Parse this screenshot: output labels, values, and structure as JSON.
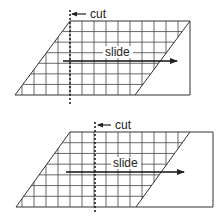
{
  "diagram": {
    "title": "",
    "colors": {
      "stroke": "#333333",
      "grid": "#444444",
      "text": "#222222",
      "background": "#ffffff"
    },
    "panels": [
      {
        "id": "before",
        "cut_label": "cut",
        "slide_label": "slide",
        "outer": {
          "x1": 15,
          "x2": 190,
          "y_top": 21,
          "y_bottom": 95,
          "top_left_x": 70
        },
        "diagonal_right": {
          "top_x": 190,
          "bottom_x": 135
        },
        "cut_x": 70,
        "cut_y1": 10,
        "cut_y2": 104,
        "cut_arrow": {
          "from_x": 86,
          "to_x": 72,
          "y": 14
        },
        "cut_text_pos": {
          "x": 90,
          "y": 18
        },
        "slide_arrow": {
          "from_x": 63,
          "to_x": 177,
          "y": 61
        },
        "slide_text_pos": {
          "x": 105,
          "y": 56
        }
      },
      {
        "id": "after",
        "cut_label": "cut",
        "slide_label": "slide",
        "outer": {
          "x1": 16,
          "x2": 213,
          "y_top": 132,
          "y_bottom": 207,
          "top_left_x": 70
        },
        "diagonal_right": {
          "top_x": 190,
          "bottom_x": 136
        },
        "cut_x": 95,
        "cut_y1": 122,
        "cut_y2": 214,
        "cut_arrow": {
          "from_x": 111,
          "to_x": 98,
          "y": 125
        },
        "cut_text_pos": {
          "x": 115,
          "y": 129
        },
        "slide_arrow": {
          "from_x": 66,
          "to_x": 184,
          "y": 172
        },
        "slide_text_pos": {
          "x": 113,
          "y": 167
        }
      }
    ]
  }
}
